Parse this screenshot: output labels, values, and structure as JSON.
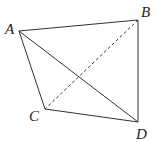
{
  "diagram": {
    "type": "geometry-tetrahedron",
    "stroke_color": "#333333",
    "background": "#ffffff",
    "points": {
      "A": {
        "label": "A",
        "x": 19,
        "y": 31
      },
      "B": {
        "label": "B",
        "x": 138,
        "y": 20
      },
      "C": {
        "label": "C",
        "x": 45,
        "y": 109
      },
      "D": {
        "label": "D",
        "x": 138,
        "y": 122
      }
    },
    "solid_edges": [
      "AB",
      "AC",
      "AD",
      "BD",
      "CD"
    ],
    "dashed_edges": [
      "BC"
    ]
  }
}
